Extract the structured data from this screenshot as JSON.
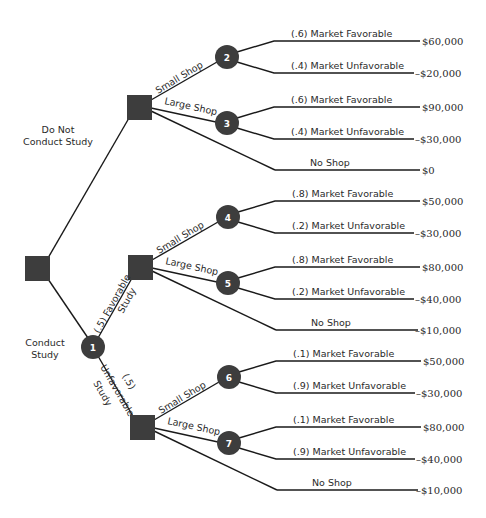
{
  "diagram": {
    "type": "decision-tree",
    "colors": {
      "node_fill": "#3d3d3d",
      "line": "#1a1a1a",
      "background": "#ffffff",
      "node_label": "#ffffff"
    },
    "root": {
      "kind": "decision"
    },
    "branches": {
      "do_not_conduct": {
        "label_line1": "Do Not",
        "label_line2": "Conduct Study"
      },
      "conduct": {
        "label_line1": "Conduct",
        "label_line2": "Study"
      }
    },
    "study_node": {
      "id": "1",
      "kind": "chance"
    },
    "study_outcomes": {
      "favorable": {
        "label_line1": "(.5) Favorable",
        "label_line2": "Study"
      },
      "unfavorable": {
        "label_line1": "(.5)",
        "label_line2": "Unfavorable",
        "label_line3": "Study"
      }
    },
    "decision_labels": {
      "small": "Small Shop",
      "large": "Large Shop",
      "none": "No Shop"
    },
    "chance_nodes": [
      {
        "id": "2",
        "outcomes": [
          {
            "label": "(.6) Market Favorable",
            "payoff": "$60,000"
          },
          {
            "label": "(.4) Market Unfavorable",
            "payoff": "–$20,000"
          }
        ]
      },
      {
        "id": "3",
        "outcomes": [
          {
            "label": "(.6) Market Favorable",
            "payoff": "$90,000"
          },
          {
            "label": "(.4) Market Unfavorable",
            "payoff": "–$30,000"
          }
        ]
      },
      {
        "id": "4",
        "outcomes": [
          {
            "label": "(.8) Market Favorable",
            "payoff": "$50,000"
          },
          {
            "label": "(.2) Market Unfavorable",
            "payoff": "–$30,000"
          }
        ]
      },
      {
        "id": "5",
        "outcomes": [
          {
            "label": "(.8) Market Favorable",
            "payoff": "$80,000"
          },
          {
            "label": "(.2) Market Unfavorable",
            "payoff": "–$40,000"
          }
        ]
      },
      {
        "id": "6",
        "outcomes": [
          {
            "label": "(.1) Market Favorable",
            "payoff": "$50,000"
          },
          {
            "label": "(.9) Market Unfavorable",
            "payoff": "–$30,000"
          }
        ]
      },
      {
        "id": "7",
        "outcomes": [
          {
            "label": "(.1) Market Favorable",
            "payoff": "$80,000"
          },
          {
            "label": "(.9) Market Unfavorable",
            "payoff": "–$40,000"
          }
        ]
      }
    ],
    "no_shop_payoffs": {
      "top": "$0",
      "favorable": "–$10,000",
      "unfavorable": "–$10,000"
    }
  }
}
